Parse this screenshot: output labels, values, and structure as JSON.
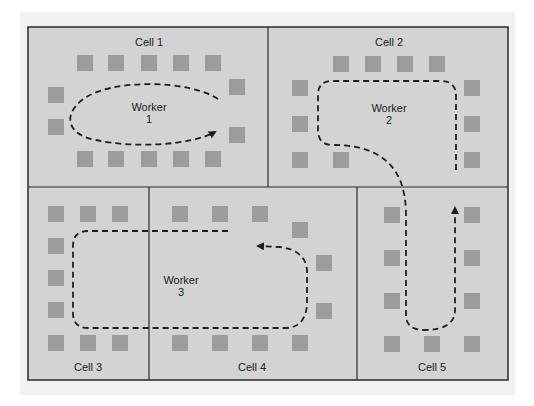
{
  "diagram": {
    "colors": {
      "floor": "#d3d3d3",
      "border": "#2a2a2a",
      "machine": "#9c9c9c",
      "path": "#1e1e1e"
    },
    "cells": [
      {
        "id": "cell-1",
        "label": "Cell 1"
      },
      {
        "id": "cell-2",
        "label": "Cell 2"
      },
      {
        "id": "cell-3",
        "label": "Cell 3"
      },
      {
        "id": "cell-4",
        "label": "Cell 4"
      },
      {
        "id": "cell-5",
        "label": "Cell 5"
      }
    ],
    "workers": [
      {
        "id": "worker-1",
        "line1": "Worker",
        "line2": "1",
        "cells": [
          "Cell 1"
        ]
      },
      {
        "id": "worker-2",
        "line1": "Worker",
        "line2": "2",
        "cells": [
          "Cell 2",
          "Cell 5"
        ]
      },
      {
        "id": "worker-3",
        "line1": "Worker",
        "line2": "3",
        "cells": [
          "Cell 3",
          "Cell 4"
        ]
      }
    ],
    "machine_counts": {
      "cell-1": 14,
      "cell-2": 11,
      "cell-3": 9,
      "cell-4": 10,
      "cell-5": 9
    }
  }
}
